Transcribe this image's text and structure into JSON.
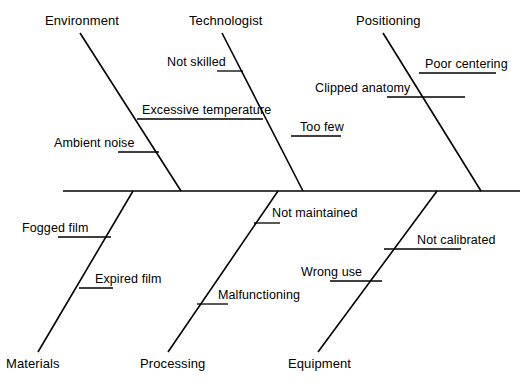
{
  "diagram": {
    "type": "fishbone",
    "line_color": "#000000",
    "background_color": "#ffffff",
    "spine": {
      "label": "spine",
      "x1": 63,
      "y1": 191,
      "x2": 520,
      "y2": 191
    },
    "categories": [
      {
        "id": "environment",
        "label": "Environment",
        "side": "above",
        "label_x": 45,
        "label_y": 14,
        "bone": {
          "x1": 80,
          "y1": 33,
          "x2": 181,
          "y2": 191
        },
        "causes": [
          {
            "id": "excessive-temperature",
            "label": "Excessive temperature",
            "label_x": 142,
            "label_y": 103,
            "tick": {
              "x1": 137,
              "y1": 119,
              "x2": 263,
              "y2": 119
            }
          },
          {
            "id": "ambient-noise",
            "label": "Ambient noise",
            "label_x": 54,
            "label_y": 136,
            "tick": {
              "x1": 118,
              "y1": 152,
              "x2": 159,
              "y2": 152
            }
          }
        ]
      },
      {
        "id": "technologist",
        "label": "Technologist",
        "side": "above",
        "label_x": 189,
        "label_y": 14,
        "bone": {
          "x1": 222,
          "y1": 33,
          "x2": 303,
          "y2": 191
        },
        "causes": [
          {
            "id": "not-skilled",
            "label": "Not skilled",
            "label_x": 167,
            "label_y": 55,
            "tick": {
              "x1": 217,
              "y1": 71,
              "x2": 243,
              "y2": 71
            }
          },
          {
            "id": "too-few",
            "label": "Too few",
            "label_x": 300,
            "label_y": 120,
            "tick": {
              "x1": 291,
              "y1": 136,
              "x2": 341,
              "y2": 136
            }
          }
        ]
      },
      {
        "id": "positioning",
        "label": "Positioning",
        "side": "above",
        "label_x": 356,
        "label_y": 14,
        "bone": {
          "x1": 383,
          "y1": 33,
          "x2": 481,
          "y2": 191
        },
        "causes": [
          {
            "id": "poor-centering",
            "label": "Poor centering",
            "label_x": 425,
            "label_y": 57,
            "tick": {
              "x1": 419,
              "y1": 73,
              "x2": 496,
              "y2": 73
            }
          },
          {
            "id": "clipped-anatomy",
            "label": "Clipped anatomy",
            "label_x": 315,
            "label_y": 81,
            "tick": {
              "x1": 387,
              "y1": 97,
              "x2": 465,
              "y2": 97
            }
          }
        ]
      },
      {
        "id": "materials",
        "label": "Materials",
        "side": "below",
        "label_x": 6,
        "label_y": 357,
        "bone": {
          "x1": 133,
          "y1": 191,
          "x2": 38,
          "y2": 352
        },
        "causes": [
          {
            "id": "fogged-film",
            "label": "Fogged film",
            "label_x": 22,
            "label_y": 221,
            "tick": {
              "x1": 58,
              "y1": 237,
              "x2": 111,
              "y2": 237
            }
          },
          {
            "id": "expired-film",
            "label": "Expired film",
            "label_x": 95,
            "label_y": 272,
            "tick": {
              "x1": 79,
              "y1": 288,
              "x2": 113,
              "y2": 288
            }
          }
        ]
      },
      {
        "id": "processing",
        "label": "Processing",
        "side": "below",
        "label_x": 140,
        "label_y": 357,
        "bone": {
          "x1": 278,
          "y1": 191,
          "x2": 168,
          "y2": 352
        },
        "causes": [
          {
            "id": "not-maintained",
            "label": "Not maintained",
            "label_x": 272,
            "label_y": 206,
            "tick": {
              "x1": 254,
              "y1": 223,
              "x2": 280,
              "y2": 223
            }
          },
          {
            "id": "malfunctioning",
            "label": "Malfunctioning",
            "label_x": 218,
            "label_y": 288,
            "tick": {
              "x1": 197,
              "y1": 304,
              "x2": 228,
              "y2": 304
            }
          }
        ]
      },
      {
        "id": "equipment",
        "label": "Equipment",
        "side": "below",
        "label_x": 288,
        "label_y": 357,
        "bone": {
          "x1": 437,
          "y1": 191,
          "x2": 318,
          "y2": 352
        },
        "causes": [
          {
            "id": "not-calibrated",
            "label": "Not calibrated",
            "label_x": 417,
            "label_y": 233,
            "tick": {
              "x1": 384,
              "y1": 249,
              "x2": 461,
              "y2": 249
            }
          },
          {
            "id": "wrong-use",
            "label": "Wrong use",
            "label_x": 301,
            "label_y": 265,
            "tick": {
              "x1": 330,
              "y1": 281,
              "x2": 382,
              "y2": 281
            }
          }
        ]
      }
    ]
  }
}
